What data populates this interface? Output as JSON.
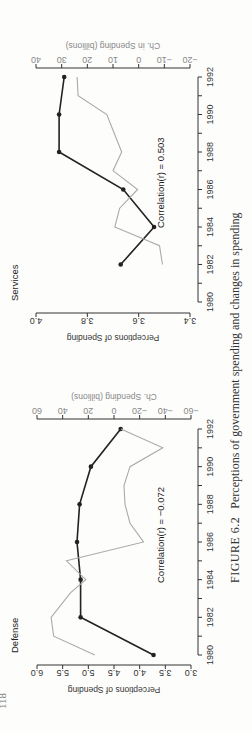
{
  "page": {
    "page_number": "118",
    "caption_label": "FIGURE 6.2",
    "caption_text": "Perceptions of government spending and changes in spending"
  },
  "chart_data": [
    {
      "type": "line",
      "title": "Defense",
      "xlabel": "",
      "ylabel": "Perceptions of Spending",
      "y2label": "Ch. Spending (billions)",
      "annotation": "Correlation(r) = −0.072",
      "x_ticks": [
        "1980",
        "1982",
        "1984",
        "1986",
        "1988",
        "1990",
        "1992"
      ],
      "xlim": [
        1980,
        1992
      ],
      "ylim": [
        3.0,
        6.0
      ],
      "y_ticks": [
        "3.0",
        "3.5",
        "4.0",
        "4.5",
        "5.0",
        "5.5",
        "6.0"
      ],
      "y2lim": [
        -60,
        60
      ],
      "y2_ticks": [
        "−60",
        "−40",
        "−20",
        "0",
        "20",
        "40",
        "60"
      ],
      "series": [
        {
          "name": "Perceptions of Spending",
          "axis": "left",
          "color": "#222222",
          "markers": true,
          "x": [
            1980,
            1982,
            1984,
            1986,
            1988,
            1990,
            1992
          ],
          "values": [
            3.73,
            5.15,
            5.15,
            5.22,
            5.17,
            4.95,
            4.37
          ]
        },
        {
          "name": "Ch. Spending (billions)",
          "axis": "right",
          "color": "#aaaaaa",
          "markers": false,
          "x": [
            1980,
            1981,
            1982,
            1983.3,
            1984,
            1985,
            1986,
            1987,
            1988,
            1989,
            1990,
            1991,
            1992
          ],
          "values": [
            15,
            47,
            49,
            34,
            22,
            37,
            -23,
            -12.5,
            -8.6,
            -7.8,
            -12.5,
            -38,
            -5.4
          ]
        }
      ]
    },
    {
      "type": "line",
      "title": "Services",
      "xlabel": "",
      "ylabel": "Perceptions of Spending",
      "y2label": "Ch. in Spending (billions)",
      "annotation": "Correlation(r) = 0.503",
      "x_ticks": [
        "1980",
        "1982",
        "1984",
        "1986",
        "1988",
        "1990",
        "1992"
      ],
      "xlim": [
        1980,
        1992
      ],
      "ylim": [
        3.4,
        4.0
      ],
      "y_ticks": [
        "3.4",
        "3.6",
        "3.8",
        "4.0"
      ],
      "y2lim": [
        -20,
        40
      ],
      "y2_ticks": [
        "−20",
        "−10",
        "0",
        "10",
        "20",
        "30",
        "40"
      ],
      "series": [
        {
          "name": "Perceptions of Spending",
          "axis": "left",
          "color": "#222222",
          "markers": true,
          "x": [
            1982,
            1984,
            1986,
            1988,
            1990,
            1992
          ],
          "values": [
            3.67,
            3.54,
            3.66,
            3.91,
            3.91,
            3.89
          ]
        },
        {
          "name": "Ch. in Spending (billions)",
          "axis": "right",
          "color": "#aaaaaa",
          "markers": false,
          "x": [
            1982,
            1983,
            1984,
            1985,
            1986,
            1987,
            1988,
            1990,
            1991,
            1992
          ],
          "values": [
            -9.3,
            -8.1,
            9.3,
            7.4,
            0.4,
            10,
            6.6,
            12.4,
            23.6,
            24
          ]
        }
      ]
    }
  ]
}
